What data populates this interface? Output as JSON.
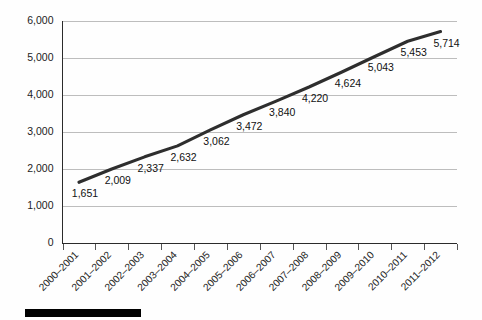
{
  "chart_data": {
    "type": "line",
    "title": "",
    "subtitle": "",
    "xlabel": "",
    "ylabel": "",
    "categories": [
      "2000–2001",
      "2001–2002",
      "2002–2003",
      "2003–2004",
      "2004–2005",
      "2005–2006",
      "2006–2007",
      "2007–2008",
      "2008–2009",
      "2009–2010",
      "2010–2011",
      "2011–2012"
    ],
    "values": [
      1651,
      2009,
      2337,
      2632,
      3062,
      3472,
      3840,
      4220,
      4624,
      5043,
      5453,
      5714
    ],
    "point_labels": [
      "1,651",
      "2,009",
      "2,337",
      "2,632",
      "3,062",
      "3,472",
      "3,840",
      "4,220",
      "4,624",
      "5,043",
      "5,453",
      "5,714"
    ],
    "ylim": [
      0,
      6000
    ],
    "ytick_values": [
      0,
      1000,
      2000,
      3000,
      4000,
      5000,
      6000
    ],
    "ytick_labels": [
      "0",
      "1,000",
      "2,000",
      "3,000",
      "4,000",
      "5,000",
      "6,000"
    ],
    "grid": true,
    "legend": null,
    "series_color": "#2e2e2e",
    "gridline_color": "#bdbdbd",
    "axis_color": "#2b2b2b",
    "background_color": "#fefefe",
    "xtick_rotation_degrees": -45
  },
  "footer": {
    "rule_color": "#000000"
  }
}
